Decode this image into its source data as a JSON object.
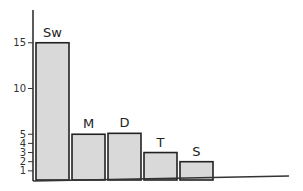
{
  "chart_data": {
    "type": "bar",
    "title": "",
    "xlabel": "",
    "ylabel": "",
    "categories": [
      "Sw",
      "M",
      "D",
      "T",
      "S"
    ],
    "values": [
      15,
      5,
      5.1,
      3,
      2
    ],
    "ylim": [
      0,
      17
    ],
    "yticks": [
      1,
      2,
      3,
      4,
      5,
      10,
      15
    ],
    "ytick_labels": [
      "1",
      "2",
      "3",
      "4",
      "5",
      "10",
      "15"
    ],
    "grid": false,
    "legend": null,
    "bar_labels_above": true
  },
  "colors": {
    "bar_fill": "#d9d9d9",
    "bar_stroke": "#222222",
    "axis": "#333333",
    "background": "#ffffff"
  }
}
